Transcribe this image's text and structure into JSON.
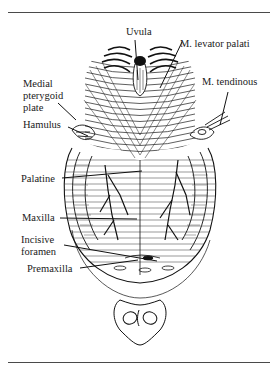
{
  "figure": {
    "labels": {
      "uvula": "Uvula",
      "levator_palati": "M. levator palati",
      "medial_pterygoid_line1": "Medial",
      "medial_pterygoid_line2": "pterygoid",
      "medial_pterygoid_line3": "plate",
      "tendinous": "M. tendinous",
      "hamulus": "Hamulus",
      "palatine": "Palatine",
      "maxilla": "Maxilla",
      "incisive_line1": "Incisive",
      "incisive_line2": "foramen",
      "premaxilla": "Premaxilla"
    },
    "colors": {
      "ink": "#1a1a1a",
      "rule": "#4a4a4a",
      "background": "#ffffff"
    }
  }
}
